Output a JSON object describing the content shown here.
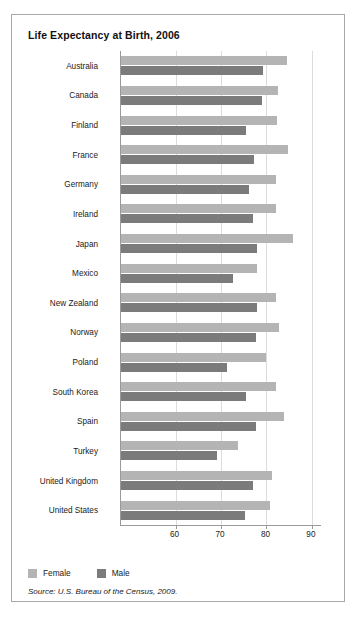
{
  "chart_data": {
    "type": "bar",
    "orientation": "horizontal",
    "title": "Life Expectancy at Birth, 2006",
    "xlabel": "",
    "ylabel": "",
    "xlim": [
      48,
      92
    ],
    "xticks": [
      60,
      70,
      80,
      90
    ],
    "xtick_labels": [
      "60",
      "70",
      "80",
      "90"
    ],
    "grid": true,
    "legend_position": "bottom-left",
    "categories": [
      "Australia",
      "Canada",
      "Finland",
      "France",
      "Germany",
      "Ireland",
      "Japan",
      "Mexico",
      "New Zealand",
      "Norway",
      "Poland",
      "South Korea",
      "Spain",
      "Turkey",
      "United Kingdom",
      "United States"
    ],
    "series": [
      {
        "name": "Female",
        "color": "#b4b4b4",
        "values": [
          84.6,
          82.6,
          82.3,
          84.7,
          82.1,
          82.1,
          85.8,
          78.0,
          82.2,
          82.7,
          80.0,
          82.0,
          83.8,
          73.7,
          81.3,
          80.8
        ]
      },
      {
        "name": "Male",
        "color": "#7b7b7b",
        "values": [
          79.3,
          79.0,
          75.6,
          77.2,
          76.2,
          77.1,
          78.0,
          72.6,
          78.0,
          77.6,
          71.3,
          75.5,
          77.7,
          69.2,
          77.0,
          75.2
        ]
      }
    ]
  },
  "legend": {
    "items": [
      {
        "label": "Female",
        "color": "#b4b4b4"
      },
      {
        "label": "Male",
        "color": "#7b7b7b"
      }
    ]
  },
  "source": {
    "text": "Source: U.S. Bureau of the Census, 2009."
  }
}
